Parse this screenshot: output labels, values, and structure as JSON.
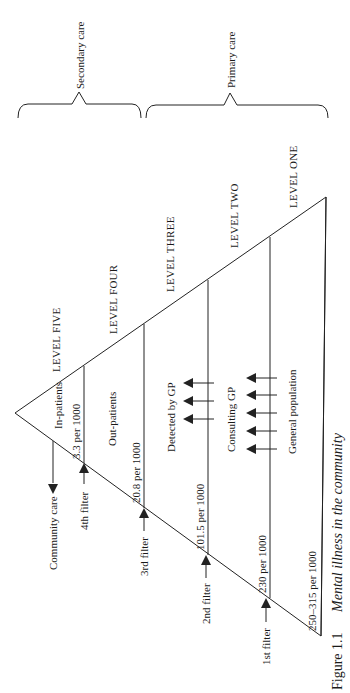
{
  "figure": {
    "number": "Figure 1.1",
    "title": "Mental illness in the community"
  },
  "braces": [
    {
      "label": "Secondary care"
    },
    {
      "label": "Primary care"
    }
  ],
  "levels": [
    {
      "name": "LEVEL FIVE",
      "population": "In-patients",
      "rate": "3.3 per 1000"
    },
    {
      "name": "LEVEL FOUR",
      "population": "Out-patients",
      "rate": "20.8 per 1000"
    },
    {
      "name": "LEVEL THREE",
      "population": "Detected by GP",
      "rate": "101.5 per 1000"
    },
    {
      "name": "LEVEL TWO",
      "population": "Consulting GP",
      "rate": "230 per 1000"
    },
    {
      "name": "LEVEL ONE",
      "population": "General population",
      "rate": "250–315 per 1000"
    }
  ],
  "filters": [
    {
      "label": "4th filter"
    },
    {
      "label": "3rd filter"
    },
    {
      "label": "2nd filter"
    },
    {
      "label": "1st filter"
    }
  ],
  "community_care": {
    "label": "Community care"
  }
}
